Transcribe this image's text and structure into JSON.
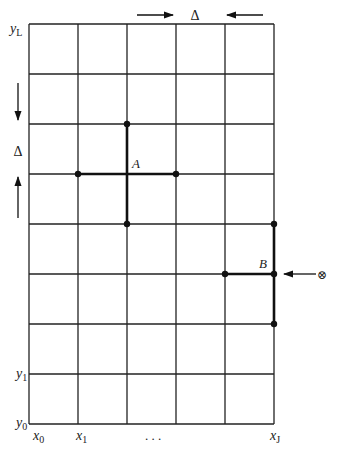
{
  "diagram": {
    "grid": {
      "x_lines": [
        29,
        78,
        127,
        176,
        225,
        274
      ],
      "y_lines": [
        24,
        74,
        124,
        174,
        224,
        274,
        324,
        374,
        424
      ],
      "line_color": "#222222"
    },
    "axis_labels": {
      "y_top": {
        "base": "y",
        "sub": "L"
      },
      "y_1": {
        "base": "y",
        "sub": "1"
      },
      "y_0": {
        "base": "y",
        "sub": "0"
      },
      "x_0": {
        "base": "x",
        "sub": "0"
      },
      "x_1": {
        "base": "x",
        "sub": "1"
      },
      "x_dots": ". . .",
      "x_last": {
        "base": "x",
        "sub": "J"
      }
    },
    "spacing_labels": {
      "horizontal": "Δ",
      "vertical": "Δ"
    },
    "points": {
      "A": {
        "label": "A",
        "center": [
          127,
          174
        ],
        "neighbors": [
          [
            78,
            174
          ],
          [
            176,
            174
          ],
          [
            127,
            124
          ],
          [
            127,
            224
          ]
        ]
      },
      "B": {
        "label": "B",
        "center": [
          274,
          274
        ],
        "neighbors": [
          [
            225,
            274
          ],
          [
            274,
            224
          ],
          [
            274,
            324
          ]
        ]
      }
    },
    "boundary_source": {
      "symbol": "⊗",
      "arrow_direction": "left"
    }
  }
}
